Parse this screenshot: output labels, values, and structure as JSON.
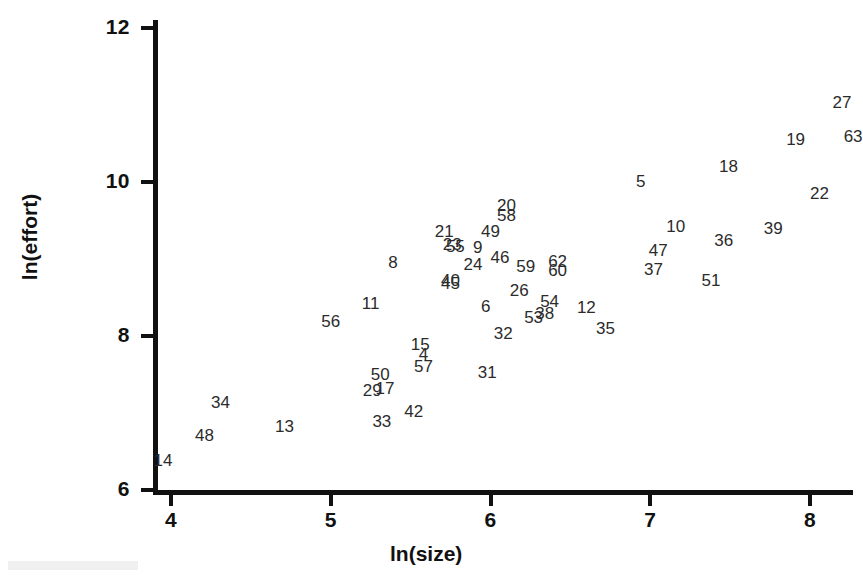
{
  "chart_data": {
    "type": "scatter",
    "title": "",
    "xlabel": "ln(size)",
    "ylabel": "ln(effort)",
    "xlim": [
      3.85,
      8.35
    ],
    "ylim": [
      5.85,
      12.2
    ],
    "xticks": [
      4,
      5,
      6,
      7,
      8
    ],
    "yticks": [
      6,
      8,
      10,
      12
    ],
    "grid": false,
    "legend": null,
    "marker_style": "numeric-label",
    "note": "Each plotted observation is rendered as its case/ID number rather than a marker symbol.",
    "points": [
      {
        "label": "14",
        "x": 3.95,
        "y": 6.38
      },
      {
        "label": "48",
        "x": 4.21,
        "y": 6.7
      },
      {
        "label": "34",
        "x": 4.31,
        "y": 7.13
      },
      {
        "label": "13",
        "x": 4.71,
        "y": 6.82
      },
      {
        "label": "33",
        "x": 5.32,
        "y": 6.88
      },
      {
        "label": "42",
        "x": 5.52,
        "y": 7.01
      },
      {
        "label": "29",
        "x": 5.26,
        "y": 7.29
      },
      {
        "label": "17",
        "x": 5.34,
        "y": 7.31
      },
      {
        "label": "50",
        "x": 5.31,
        "y": 7.49
      },
      {
        "label": "57",
        "x": 5.58,
        "y": 7.6
      },
      {
        "label": "4",
        "x": 5.58,
        "y": 7.75
      },
      {
        "label": "15",
        "x": 5.56,
        "y": 7.88
      },
      {
        "label": "31",
        "x": 5.98,
        "y": 7.52
      },
      {
        "label": "56",
        "x": 5.0,
        "y": 8.18
      },
      {
        "label": "11",
        "x": 5.25,
        "y": 8.42
      },
      {
        "label": "32",
        "x": 6.08,
        "y": 8.02
      },
      {
        "label": "53",
        "x": 6.27,
        "y": 8.24
      },
      {
        "label": "38",
        "x": 6.34,
        "y": 8.29
      },
      {
        "label": "35",
        "x": 6.72,
        "y": 8.09
      },
      {
        "label": "12",
        "x": 6.6,
        "y": 8.36
      },
      {
        "label": "54",
        "x": 6.37,
        "y": 8.44
      },
      {
        "label": "6",
        "x": 5.97,
        "y": 8.38
      },
      {
        "label": "26",
        "x": 6.18,
        "y": 8.58
      },
      {
        "label": "45",
        "x": 5.75,
        "y": 8.68
      },
      {
        "label": "40",
        "x": 5.75,
        "y": 8.72
      },
      {
        "label": "8",
        "x": 5.39,
        "y": 8.95
      },
      {
        "label": "24",
        "x": 5.89,
        "y": 8.92
      },
      {
        "label": "60",
        "x": 6.42,
        "y": 8.84
      },
      {
        "label": "59",
        "x": 6.22,
        "y": 8.9
      },
      {
        "label": "62",
        "x": 6.42,
        "y": 8.96
      },
      {
        "label": "46",
        "x": 6.06,
        "y": 9.01
      },
      {
        "label": "9",
        "x": 5.92,
        "y": 9.14
      },
      {
        "label": "55",
        "x": 5.78,
        "y": 9.15
      },
      {
        "label": "23",
        "x": 5.76,
        "y": 9.18
      },
      {
        "label": "21",
        "x": 5.71,
        "y": 9.35
      },
      {
        "label": "49",
        "x": 6.0,
        "y": 9.35
      },
      {
        "label": "58",
        "x": 6.1,
        "y": 9.56
      },
      {
        "label": "20",
        "x": 6.1,
        "y": 9.69
      },
      {
        "label": "37",
        "x": 7.02,
        "y": 8.86
      },
      {
        "label": "51",
        "x": 7.38,
        "y": 8.72
      },
      {
        "label": "47",
        "x": 7.05,
        "y": 9.1
      },
      {
        "label": "36",
        "x": 7.46,
        "y": 9.23
      },
      {
        "label": "10",
        "x": 7.16,
        "y": 9.42
      },
      {
        "label": "39",
        "x": 7.77,
        "y": 9.39
      },
      {
        "label": "5",
        "x": 6.94,
        "y": 10.0
      },
      {
        "label": "22",
        "x": 8.06,
        "y": 9.85
      },
      {
        "label": "18",
        "x": 7.49,
        "y": 10.2
      },
      {
        "label": "63",
        "x": 8.27,
        "y": 10.58
      },
      {
        "label": "19",
        "x": 7.91,
        "y": 10.55
      },
      {
        "label": "27",
        "x": 8.2,
        "y": 11.02
      }
    ]
  },
  "axes": {
    "x": {
      "title": "ln(size)",
      "tick_labels": [
        "4",
        "5",
        "6",
        "7",
        "8"
      ]
    },
    "y": {
      "title": "ln(effort)",
      "tick_labels": [
        "6",
        "8",
        "10",
        "12"
      ]
    }
  },
  "colors": {
    "background": "#ffffff",
    "axis": "#111111",
    "label": "#2b2b2b"
  }
}
